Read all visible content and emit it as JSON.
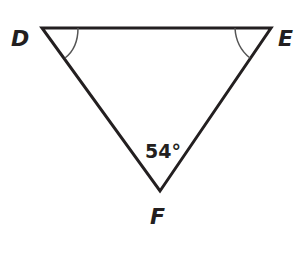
{
  "diagram": {
    "type": "triangle",
    "vertices": [
      {
        "label": "D",
        "x": 42,
        "y": 28
      },
      {
        "label": "E",
        "x": 271,
        "y": 28
      },
      {
        "label": "F",
        "x": 160,
        "y": 191
      }
    ],
    "angle_marks": [
      {
        "vertex": "D",
        "style": "single-arc",
        "congruent_with": "E"
      },
      {
        "vertex": "E",
        "style": "single-arc",
        "congruent_with": "D"
      }
    ],
    "angle_labels": [
      {
        "vertex": "F",
        "text": "54°"
      }
    ],
    "colors": {
      "stroke": "#231f20",
      "arc": "#555555",
      "background": "#ffffff"
    }
  }
}
